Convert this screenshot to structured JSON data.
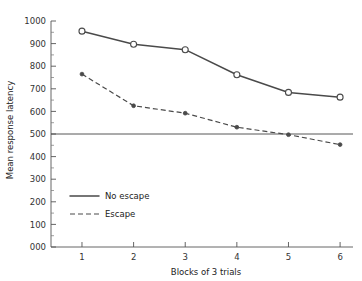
{
  "chart_data": {
    "type": "line",
    "title": "",
    "xlabel": "Blocks of 3 trials",
    "ylabel": "Mean response latency",
    "categories": [
      "1",
      "2",
      "3",
      "4",
      "5",
      "6"
    ],
    "x": [
      1,
      2,
      3,
      4,
      5,
      6
    ],
    "xlim": [
      0.4,
      6.25
    ],
    "ylim": [
      0,
      1000
    ],
    "y_ticks": [
      "000",
      "100",
      "200",
      "300",
      "400",
      "500",
      "600",
      "700",
      "800",
      "900",
      "1000"
    ],
    "y_tick_values": [
      0,
      100,
      200,
      300,
      400,
      500,
      600,
      700,
      800,
      900,
      1000
    ],
    "y_minor_step": 50,
    "grid": false,
    "legend_position": "inside-lower-left",
    "reference_line": {
      "value": 500,
      "orientation": "horizontal"
    },
    "series": [
      {
        "name": "No escape",
        "style": "solid",
        "marker": "open-circle",
        "color": "#4a4a4a",
        "values": [
          955,
          897,
          873,
          762,
          684,
          663
        ]
      },
      {
        "name": "Escape",
        "style": "dashed",
        "marker": "filled-circle",
        "color": "#4a4a4a",
        "values": [
          765,
          625,
          592,
          530,
          497,
          453
        ]
      }
    ],
    "legend": [
      {
        "label": "No escape",
        "style": "solid",
        "color": "#4a4a4a"
      },
      {
        "label": "Escape",
        "style": "dashed",
        "color": "#4a4a4a"
      }
    ]
  }
}
